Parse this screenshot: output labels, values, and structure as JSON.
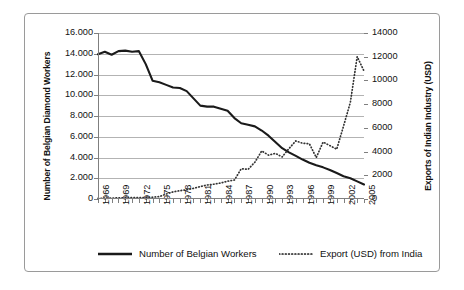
{
  "chart_data": {
    "type": "line",
    "title": "",
    "xlabel": "",
    "ylabel": "Number of Belgian Diamond Workers",
    "y2label": "Exports of Indian Industry (USD)",
    "grid": true,
    "legend_position": "bottom",
    "ylim": [
      0,
      16000
    ],
    "y2lim": [
      0,
      14000
    ],
    "ytick_labels": [
      "16.000",
      "14.000",
      "12.000",
      "10.000",
      "8.000",
      "6.000",
      "4.000",
      "2.000",
      "0"
    ],
    "ytick_values": [
      16000,
      14000,
      12000,
      10000,
      8000,
      6000,
      4000,
      2000,
      0
    ],
    "y2tick_labels": [
      "14000",
      "12000",
      "10000",
      "8000",
      "6000",
      "4000",
      "2000",
      "0"
    ],
    "y2tick_values": [
      14000,
      12000,
      10000,
      8000,
      6000,
      4000,
      2000,
      0
    ],
    "x": [
      1966,
      1967,
      1968,
      1969,
      1970,
      1971,
      1972,
      1973,
      1974,
      1975,
      1976,
      1977,
      1978,
      1979,
      1980,
      1981,
      1982,
      1983,
      1984,
      1985,
      1986,
      1987,
      1988,
      1989,
      1990,
      1991,
      1992,
      1993,
      1994,
      1995,
      1996,
      1997,
      1998,
      1999,
      2000,
      2001,
      2002,
      2003,
      2004,
      2005
    ],
    "xtick_labels": [
      "1966",
      "1969",
      "1972",
      "1975",
      "1978",
      "1981",
      "1984",
      "1987",
      "1990",
      "1993",
      "1996",
      "1999",
      "2002",
      "2005"
    ],
    "xtick_values": [
      1966,
      1969,
      1972,
      1975,
      1978,
      1981,
      1984,
      1987,
      1990,
      1993,
      1996,
      1999,
      2002,
      2005
    ],
    "series": [
      {
        "name": "Number of Belgian Workers",
        "axis": "left",
        "style": "solid",
        "color": "#1a1a1a",
        "values": [
          13950,
          14200,
          13900,
          14250,
          14300,
          14200,
          14250,
          13000,
          11400,
          11250,
          11000,
          10750,
          10700,
          10400,
          9700,
          9000,
          8900,
          8900,
          8700,
          8500,
          7800,
          7300,
          7150,
          7000,
          6600,
          6100,
          5500,
          4900,
          4500,
          4150,
          3800,
          3500,
          3250,
          3050,
          2800,
          2500,
          2200,
          2000,
          1700,
          1400
        ]
      },
      {
        "name": "Export (USD) from India",
        "axis": "right",
        "style": "dotted",
        "color": "#333333",
        "values": [
          60,
          70,
          80,
          90,
          100,
          110,
          120,
          130,
          150,
          200,
          420,
          600,
          700,
          780,
          900,
          1050,
          1180,
          1250,
          1350,
          1500,
          1600,
          2550,
          2500,
          3100,
          4050,
          3700,
          3850,
          3550,
          4250,
          4900,
          4700,
          4650,
          3500,
          4800,
          4500,
          4200,
          6150,
          8150,
          12000,
          10800
        ]
      }
    ]
  },
  "legend": {
    "items": [
      {
        "label": "Number of Belgian Workers",
        "style": "solid"
      },
      {
        "label": "Export (USD) from India",
        "style": "dotted"
      }
    ]
  }
}
